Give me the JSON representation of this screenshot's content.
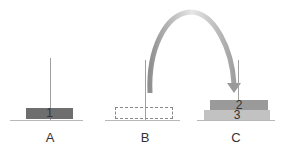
{
  "diagram": {
    "pegs": [
      {
        "label": "A",
        "disks": [
          "1"
        ]
      },
      {
        "label": "B",
        "disks": [],
        "placeholder": "empty slot (dashed)"
      },
      {
        "label": "C",
        "disks": [
          "2",
          "3"
        ]
      }
    ],
    "arrow": {
      "from": "B",
      "to": "C",
      "icon": "curved-arrow-icon"
    },
    "colors": {
      "disk1": "#6e6e6e",
      "disk2": "#9a9a9a",
      "disk3": "#c2c2c2",
      "arrow": "#a8a8a8",
      "peg": "#a0a0a0",
      "base": "#b8b8b8"
    }
  }
}
